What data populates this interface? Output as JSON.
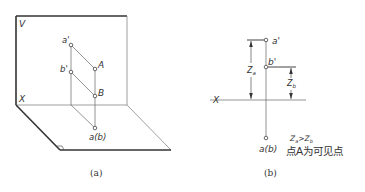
{
  "figure_a": {
    "caption": "(a)",
    "plane_v_label": "V",
    "axis_label": "X",
    "points": {
      "a_prime": "a'",
      "b_prime": "b'",
      "A": "A",
      "B": "B",
      "ab": "a(b)"
    }
  },
  "figure_b": {
    "caption": "(b)",
    "axis_label": "X",
    "points": {
      "a_prime": "a'",
      "b_prime": "b'",
      "ab": "a(b)"
    },
    "dim_za": "Z",
    "dim_za_sub": "a",
    "dim_zb": "Z",
    "dim_zb_sub": "b",
    "relation": {
      "left": "Z",
      "left_sub": "a",
      "op": ">",
      "right": "Z",
      "right_sub": "b"
    },
    "conclusion": "点A为可见点"
  },
  "colors": {
    "line": "#555555",
    "heavy": "#333333",
    "text": "#333333"
  }
}
